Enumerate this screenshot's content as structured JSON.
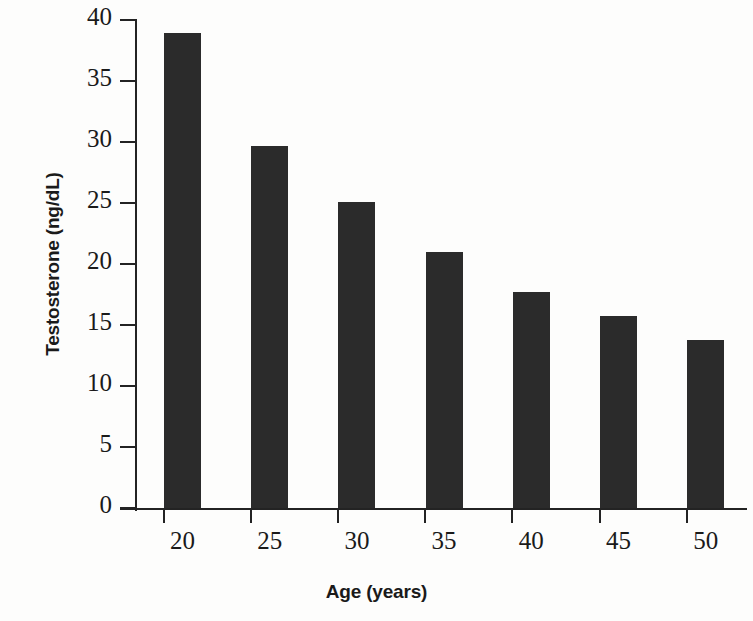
{
  "chart_data": {
    "type": "bar",
    "title": "",
    "xlabel": "Age (years)",
    "ylabel": "Testosterone (ng/dL)",
    "categories": [
      "20",
      "25",
      "30",
      "35",
      "40",
      "45",
      "50"
    ],
    "values": [
      38.9,
      29.7,
      25.1,
      21.0,
      17.7,
      15.7,
      13.8
    ],
    "ylim": [
      0,
      40
    ],
    "ytick_values": [
      0,
      5,
      10,
      15,
      20,
      25,
      30,
      35,
      40
    ],
    "ytick_labels": [
      "0",
      "5",
      "10",
      "15",
      "20",
      "25",
      "30",
      "35",
      "40"
    ],
    "grid": false,
    "legend": "none",
    "bar_color": "#2b2b2b",
    "axis_color": "#232323",
    "background_color": "#fdfdfc"
  },
  "ghost_text": {
    "line1": "a",
    "line2": "b"
  }
}
